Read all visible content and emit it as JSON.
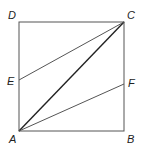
{
  "diagram": {
    "type": "geometry-square",
    "labels": {
      "A": "A",
      "B": "B",
      "C": "C",
      "D": "D",
      "E": "E",
      "F": "F"
    },
    "points": {
      "A": [
        19,
        131
      ],
      "B": [
        124,
        131
      ],
      "C": [
        124,
        22
      ],
      "D": [
        19,
        22
      ],
      "E": [
        19,
        80
      ],
      "F": [
        124,
        84
      ]
    },
    "segments": [
      [
        "A",
        "B"
      ],
      [
        "B",
        "C"
      ],
      [
        "C",
        "D"
      ],
      [
        "D",
        "A"
      ],
      [
        "A",
        "C"
      ],
      [
        "E",
        "C"
      ],
      [
        "A",
        "F"
      ]
    ],
    "colors": {
      "stroke": "#555555",
      "diagonal": "#222222",
      "label": "#222222"
    }
  }
}
